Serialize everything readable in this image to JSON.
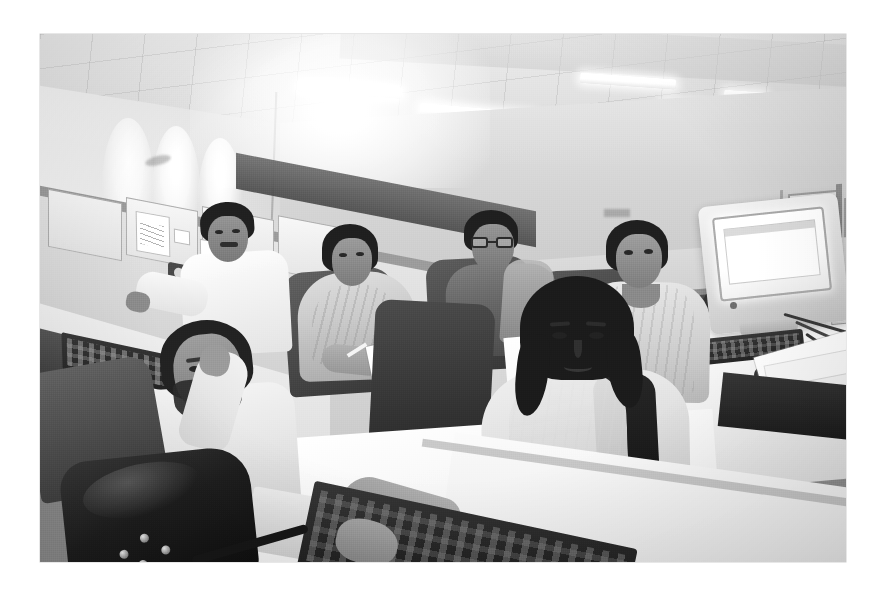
{
  "page": {
    "background_color": "#ffffff",
    "width": 883,
    "height": 594
  },
  "photo": {
    "alt": "Black and white photograph of an open-plan office",
    "medium": "black-and-white photograph",
    "frame": {
      "left": 40,
      "top": 34,
      "width": 806,
      "height": 528
    },
    "palette": {
      "paper_white": "#ffffff",
      "highlight": "#fbfbfa",
      "wall_light": "#e3e3e1",
      "midtone": "#8d8d8d",
      "partition_dark": "#3c3c3a",
      "shadow": "#141412"
    },
    "scene": {
      "setting": "open-plan office / call centre",
      "lighting": "overhead fluorescent ceiling tubes with wall-wash pools on the left wall",
      "viewpoint": "elevated wide angle looking down across desks"
    },
    "ceiling": {
      "name": "suspended tile ceiling",
      "light_fixtures": 6,
      "fixture_type": "recessed fluorescent tube"
    },
    "back_wall": {
      "name": "painted back wall",
      "features": [
        "glass double doors",
        "air vent",
        "small wall sign",
        "potted plant"
      ]
    },
    "cubicles": {
      "near_left_panels": 4,
      "pinned_items": [
        "handwritten note",
        "small slip",
        "small slip"
      ],
      "desk_items_left": [
        "keyboard",
        "monitor",
        "mouse",
        "loose paper",
        "power outlet",
        "paper cup"
      ]
    },
    "workstation_right": {
      "monitor": "CRT monitor, screen lit white",
      "peripherals": [
        "keyboard",
        "mouse",
        "cables",
        "wall outlet plate"
      ],
      "papers_on_desk": 3
    },
    "foreground_desk": {
      "items": [
        "dark keyboard",
        "mouse pad",
        "dark shoulder bag with metal studs"
      ]
    },
    "people": [
      {
        "id": "p1",
        "position": "foreground left",
        "description": "seated man with beard in light shirt, hand raised to head, looking at camera"
      },
      {
        "id": "p2",
        "position": "back left",
        "description": "man in white shirt with moustache seated at cubicle, turned toward camera"
      },
      {
        "id": "p3",
        "position": "centre left",
        "description": "woman in shawl writing on a sheet of paper"
      },
      {
        "id": "p4",
        "position": "centre back",
        "description": "person wearing glasses seated at desk, looking toward camera"
      },
      {
        "id": "p5",
        "position": "right",
        "description": "smiling woman in light shawl seated beside the CRT monitor"
      },
      {
        "id": "p6",
        "position": "centre foreground",
        "description": "young woman in light kurta and dupatta, hands at the keyboard, smiling at camera"
      }
    ],
    "person_count": 6,
    "furniture": {
      "chairs": 7,
      "desks": 4
    }
  }
}
